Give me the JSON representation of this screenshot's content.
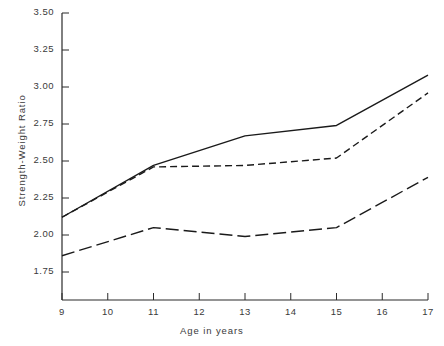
{
  "chart_data": {
    "type": "line",
    "title": "",
    "xlabel": "Age in years",
    "ylabel": "Strength-Weight Ratio",
    "x": [
      9,
      11,
      13,
      15,
      17
    ],
    "xlim": [
      9,
      17
    ],
    "ylim": [
      1.6875,
      3.5
    ],
    "grid": false,
    "legend": "none",
    "xticks": [
      "9",
      "10",
      "11",
      "12",
      "13",
      "14",
      "15",
      "16",
      "17"
    ],
    "xtick_values": [
      9,
      10,
      11,
      12,
      13,
      14,
      15,
      16,
      17
    ],
    "yticks": [
      "1.75",
      "2.00",
      "2.25",
      "2.50",
      "2.75",
      "3.00",
      "3.25",
      "3.50"
    ],
    "ytick_values": [
      1.75,
      2.0,
      2.25,
      2.5,
      2.75,
      3.0,
      3.25,
      3.5
    ],
    "series": [
      {
        "name": "solid-series",
        "style": "solid",
        "color": "#1a1a1a",
        "values": [
          2.12,
          2.47,
          2.67,
          2.74,
          3.08
        ]
      },
      {
        "name": "short-dashed-series",
        "style": "short-dash",
        "color": "#1a1a1a",
        "values": [
          2.12,
          2.46,
          2.47,
          2.52,
          2.96
        ]
      },
      {
        "name": "long-dashed-series",
        "style": "long-dash",
        "color": "#1a1a1a",
        "values": [
          1.86,
          2.05,
          1.99,
          2.05,
          2.39
        ]
      }
    ]
  },
  "axes": {
    "y_axis_name": "y-axis-line",
    "x_axis_name": "x-axis-line"
  }
}
